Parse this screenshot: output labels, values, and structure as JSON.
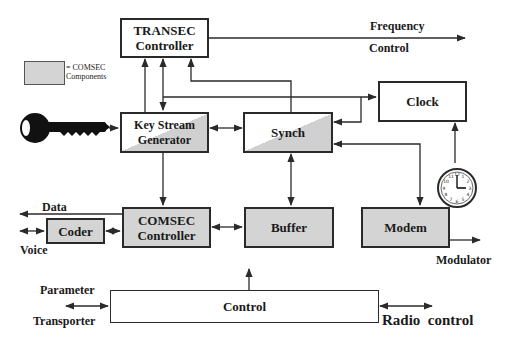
{
  "legend": {
    "line1": "= COMSEC",
    "line2": "Components",
    "swatch_color": "#d4d4d4"
  },
  "blocks": {
    "transec": {
      "line1": "TRANSEC",
      "line2": "Controller",
      "type": "plain"
    },
    "keystream": {
      "line1": "Key Stream",
      "line2": "Generator",
      "type": "comsec-partial"
    },
    "synch": {
      "line1": "Synch",
      "type": "comsec-partial"
    },
    "clock": {
      "line1": "Clock",
      "type": "plain"
    },
    "coder": {
      "line1": "Coder",
      "type": "comsec"
    },
    "comsec": {
      "line1": "COMSEC",
      "line2": "Controller",
      "type": "comsec"
    },
    "buffer": {
      "line1": "Buffer",
      "type": "comsec"
    },
    "modem": {
      "line1": "Modem",
      "type": "comsec"
    },
    "control": {
      "line1": "Control",
      "type": "plain"
    }
  },
  "labels": {
    "frequency": "Frequency",
    "frequency_control": "Control",
    "data": "Data",
    "voice": "Voice",
    "modulator": "Modulator",
    "parameter": "Parameter",
    "transporter": "Transporter",
    "radio_control": "Radio  control"
  },
  "icons": {
    "key": "key-icon",
    "clock": "clock-icon"
  },
  "colors": {
    "line": "#2a2a2a",
    "comsec_fill": "#d4d4d4"
  }
}
